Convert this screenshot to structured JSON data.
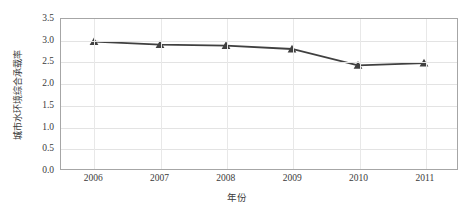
{
  "chart_data": {
    "type": "line",
    "title": "",
    "xlabel": "年份",
    "ylabel": "城市水环境综合承载率",
    "categories": [
      "2006",
      "2007",
      "2008",
      "2009",
      "2010",
      "2011"
    ],
    "x": [
      2006,
      2007,
      2008,
      2009,
      2010,
      2011
    ],
    "values": [
      2.97,
      2.9,
      2.88,
      2.8,
      2.42,
      2.47
    ],
    "series": [
      {
        "name": "城市水环境综合承载率",
        "values": [
          2.97,
          2.9,
          2.88,
          2.8,
          2.42,
          2.47
        ]
      }
    ],
    "ylim": [
      0.0,
      3.5
    ],
    "ytick_labels": [
      "0.0",
      "0.5",
      "1.0",
      "1.5",
      "2.0",
      "2.5",
      "3.0",
      "3.5"
    ],
    "ytick_values": [
      0.0,
      0.5,
      1.0,
      1.5,
      2.0,
      2.5,
      3.0,
      3.5
    ],
    "xtick_labels": [
      "2006",
      "2007",
      "2008",
      "2009",
      "2010",
      "2011"
    ],
    "grid": true,
    "legend": false,
    "marker": "triangle",
    "series_color": "#404040",
    "grid_color": "#e3e3e3",
    "axis_color": "#a6a6a6",
    "background": "#ffffff"
  }
}
